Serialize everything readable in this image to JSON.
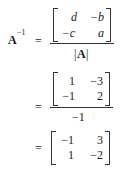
{
  "equation": {
    "lhs": {
      "symbol": "A",
      "superscript": "−1",
      "equals": "="
    },
    "step1": {
      "matrix": [
        [
          "d",
          "−b"
        ],
        [
          "−c",
          "a"
        ]
      ],
      "denominator": {
        "bar_left": "|",
        "symbol": "A",
        "bar_right": "|"
      }
    },
    "step2": {
      "equals": "=",
      "matrix": [
        [
          "1",
          "−3"
        ],
        [
          "−1",
          "2"
        ]
      ],
      "denominator": "−1"
    },
    "step3": {
      "equals": "=",
      "matrix": [
        [
          "−1",
          "3"
        ],
        [
          "1",
          "−2"
        ]
      ]
    }
  }
}
